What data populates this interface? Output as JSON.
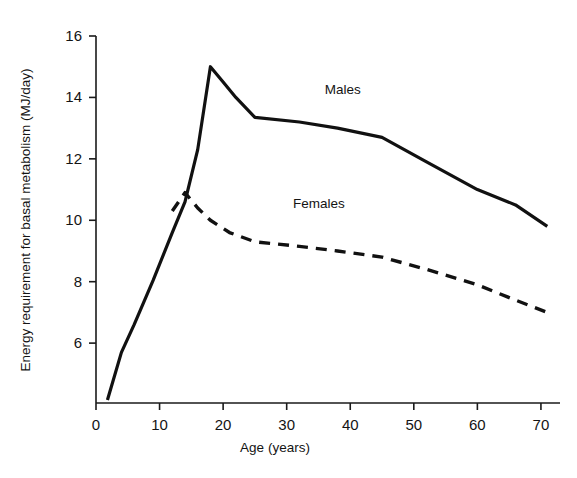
{
  "chart_data": {
    "type": "line",
    "title": "",
    "xlabel": "Age (years)",
    "ylabel": "Energy requirement for basal metabolism (MJ/day)",
    "xlim": [
      0,
      73
    ],
    "ylim": [
      4.05,
      16.0
    ],
    "xticks": [
      0,
      10,
      20,
      30,
      40,
      50,
      60,
      70
    ],
    "yticks": [
      6,
      8,
      10,
      12,
      14,
      16
    ],
    "xtick_labels": [
      "0",
      "10",
      "20",
      "30",
      "40",
      "50",
      "60",
      "70"
    ],
    "ytick_labels": [
      "6",
      "8",
      "10",
      "12",
      "14",
      "16"
    ],
    "grid": false,
    "legend_position": "inline-annotations",
    "series": [
      {
        "name": "Males",
        "style": "solid",
        "color": "#111111",
        "label_x": 36,
        "label_y": 14.1,
        "x": [
          1.8,
          4,
          6,
          9,
          12,
          14,
          16,
          18,
          20,
          22,
          25,
          32,
          38,
          45,
          52,
          60,
          66,
          71
        ],
        "values": [
          4.15,
          5.7,
          6.6,
          8.05,
          9.6,
          10.6,
          12.3,
          15.0,
          14.5,
          14.0,
          13.35,
          13.2,
          13.0,
          12.7,
          11.9,
          11.0,
          10.5,
          9.8
        ]
      },
      {
        "name": "Females",
        "style": "dashed",
        "color": "#111111",
        "label_x": 31,
        "label_y": 10.4,
        "x": [
          12,
          14,
          16,
          18,
          21,
          25,
          32,
          38,
          45,
          52,
          60,
          66,
          71
        ],
        "values": [
          10.3,
          10.9,
          10.4,
          10.0,
          9.6,
          9.3,
          9.15,
          9.0,
          8.8,
          8.4,
          7.9,
          7.4,
          7.0
        ]
      }
    ]
  },
  "axes": {
    "x_title": "Age (years)",
    "y_title": "Energy requirement for basal metabolism (MJ/day)"
  },
  "annotations": {
    "males_label": "Males",
    "females_label": "Females"
  },
  "colors": {
    "line": "#111111",
    "axis": "#1a1a1a",
    "background": "#ffffff"
  }
}
